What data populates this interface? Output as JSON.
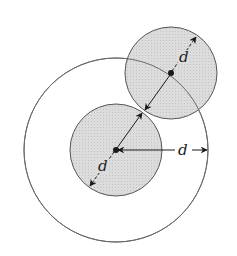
{
  "diagram": {
    "title": "",
    "colors": {
      "background": "#ffffff",
      "stroke": "#555555",
      "fill": "#d9d9d9",
      "ink": "#1a1a1a"
    },
    "outer_circle": {
      "cx": 116,
      "cy": 150,
      "r": 92
    },
    "inner_circle": {
      "cx": 116,
      "cy": 150,
      "r": 46
    },
    "neighbor_circle": {
      "cx": 171,
      "cy": 73,
      "r": 46
    },
    "labels": {
      "inner_radius": "d",
      "neighbor_radius": "d",
      "outer_gap": "d"
    }
  }
}
